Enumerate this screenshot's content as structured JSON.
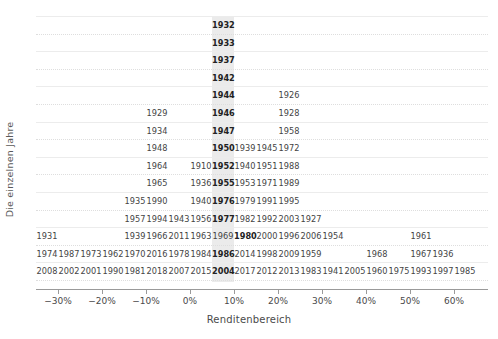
{
  "chart_data": {
    "type": "bar",
    "subtype": "year-stacked-histogram",
    "title": "",
    "xlabel": "Renditenbereich",
    "ylabel": "Die einzelnen Jahre",
    "xlim": [
      -35,
      70
    ],
    "bin_width": 5,
    "grid": true,
    "legend": null,
    "highlight": {
      "bin_label": "10%",
      "bin_start": 10,
      "bin_end": 15,
      "color": "#e8e8e8"
    },
    "x_ticks": [
      {
        "value": -30,
        "label": "−30%"
      },
      {
        "value": -20,
        "label": "−20%"
      },
      {
        "value": -10,
        "label": "−10%"
      },
      {
        "value": 0,
        "label": "0%"
      },
      {
        "value": 10,
        "label": "10%"
      },
      {
        "value": 20,
        "label": "20%"
      },
      {
        "value": 30,
        "label": "30%"
      },
      {
        "value": 40,
        "label": "40%"
      },
      {
        "value": 50,
        "label": "50%"
      },
      {
        "value": 60,
        "label": "60%"
      }
    ],
    "bins": [
      {
        "start": -35,
        "center": -32.5,
        "years": [
          "1931",
          "1974",
          "2008"
        ]
      },
      {
        "start": -30,
        "center": -27.5,
        "years": [
          "1987",
          "2002"
        ]
      },
      {
        "start": -25,
        "center": -22.5,
        "years": [
          "1973",
          "2001"
        ]
      },
      {
        "start": -20,
        "center": -17.5,
        "years": [
          "1962",
          "1990"
        ]
      },
      {
        "start": -15,
        "center": -12.5,
        "years": [
          "1935",
          "1957",
          "1939",
          "1970",
          "1981"
        ]
      },
      {
        "start": -10,
        "center": -7.5,
        "years": [
          "1929",
          "1934",
          "1948",
          "1964",
          "1965",
          "1990",
          "1994",
          "1966",
          "2016",
          "2018"
        ]
      },
      {
        "start": -5,
        "center": -2.5,
        "years": [
          "1943",
          "2011",
          "1978",
          "2007"
        ]
      },
      {
        "start": 0,
        "center": 2.5,
        "years": [
          "1910",
          "1936",
          "1940",
          "1956",
          "1963",
          "1984",
          "2015"
        ]
      },
      {
        "start": 5,
        "center": 7.5,
        "years": [
          "1939",
          "1940",
          "1953",
          "1979",
          "1982",
          "1969",
          "1986",
          "2017"
        ]
      },
      {
        "start": 10,
        "center": 12.5,
        "years": [
          "1932",
          "1933",
          "1937",
          "1942",
          "1944",
          "1946",
          "1947",
          "1950",
          "1952",
          "1955",
          "1976",
          "1977",
          "1980",
          "1986",
          "2004"
        ]
      },
      {
        "start": 15,
        "center": 17.5,
        "years": [
          "1939",
          "1940",
          "1953",
          "1979",
          "1982",
          "2000",
          "2014",
          "2017"
        ]
      },
      {
        "start": 20,
        "center": 22.5,
        "years": [
          "1945",
          "1951",
          "1971",
          "1991",
          "1992",
          "1996",
          "1998",
          "2012"
        ]
      },
      {
        "start": 25,
        "center": 27.5,
        "years": [
          "1972",
          "1988",
          "1989",
          "1995",
          "2003",
          "2006",
          "2009",
          "2013"
        ]
      },
      {
        "start": 30,
        "center": 32.5,
        "years": [
          "1927",
          "1954",
          "1959",
          "1983"
        ]
      },
      {
        "start": 35,
        "center": 37.5,
        "years": [
          "1941"
        ]
      },
      {
        "start": 40,
        "center": 42.5,
        "years": [
          "2005"
        ]
      },
      {
        "start": 45,
        "center": 47.5,
        "years": [
          "1968",
          "1960"
        ]
      },
      {
        "start": 50,
        "center": 52.5,
        "years": [
          "1961",
          "1967",
          "1975"
        ]
      },
      {
        "start": 55,
        "center": 57.5,
        "years": [
          "1936",
          "1993"
        ]
      },
      {
        "start": 60,
        "center": 62.5,
        "years": [
          "1997"
        ]
      },
      {
        "start": 65,
        "center": 67.5,
        "years": [
          "1985"
        ]
      }
    ],
    "rows": [
      {
        "row": 1,
        "cells": [
          {
            "col": 9,
            "year": "1932",
            "modal": true
          }
        ]
      },
      {
        "row": 2,
        "cells": [
          {
            "col": 9,
            "year": "1933",
            "modal": true
          }
        ]
      },
      {
        "row": 3,
        "cells": [
          {
            "col": 9,
            "year": "1937",
            "modal": true
          }
        ]
      },
      {
        "row": 4,
        "cells": [
          {
            "col": 9,
            "year": "1942",
            "modal": true
          }
        ]
      },
      {
        "row": 5,
        "cells": [
          {
            "col": 9,
            "year": "1944",
            "modal": true
          },
          {
            "col": 12,
            "year": "1926",
            "modal": false
          }
        ]
      },
      {
        "row": 6,
        "cells": [
          {
            "col": 6,
            "year": "1929",
            "modal": false
          },
          {
            "col": 9,
            "year": "1946",
            "modal": true
          },
          {
            "col": 12,
            "year": "1928",
            "modal": false
          }
        ]
      },
      {
        "row": 7,
        "cells": [
          {
            "col": 6,
            "year": "1934",
            "modal": false
          },
          {
            "col": 9,
            "year": "1947",
            "modal": true
          },
          {
            "col": 12,
            "year": "1958",
            "modal": false
          }
        ]
      },
      {
        "row": 8,
        "cells": [
          {
            "col": 6,
            "year": "1948",
            "modal": false
          },
          {
            "col": 9,
            "year": "1950",
            "modal": true
          },
          {
            "col": 10,
            "year": "1939",
            "modal": false
          },
          {
            "col": 11,
            "year": "1945",
            "modal": false
          },
          {
            "col": 12,
            "year": "1972",
            "modal": false
          }
        ]
      },
      {
        "row": 9,
        "cells": [
          {
            "col": 6,
            "year": "1964",
            "modal": false
          },
          {
            "col": 8,
            "year": "1910",
            "modal": false
          },
          {
            "col": 9,
            "year": "1952",
            "modal": true
          },
          {
            "col": 10,
            "year": "1940",
            "modal": false
          },
          {
            "col": 11,
            "year": "1951",
            "modal": false
          },
          {
            "col": 12,
            "year": "1988",
            "modal": false
          }
        ]
      },
      {
        "row": 10,
        "cells": [
          {
            "col": 6,
            "year": "1965",
            "modal": false
          },
          {
            "col": 8,
            "year": "1936",
            "modal": false
          },
          {
            "col": 9,
            "year": "1955",
            "modal": true
          },
          {
            "col": 10,
            "year": "1953",
            "modal": false
          },
          {
            "col": 11,
            "year": "1971",
            "modal": false
          },
          {
            "col": 12,
            "year": "1989",
            "modal": false
          }
        ]
      },
      {
        "row": 11,
        "cells": [
          {
            "col": 5,
            "year": "1935",
            "modal": false
          },
          {
            "col": 6,
            "year": "1990",
            "modal": false
          },
          {
            "col": 8,
            "year": "1940",
            "modal": false
          },
          {
            "col": 9,
            "year": "1976",
            "modal": true
          },
          {
            "col": 10,
            "year": "1979",
            "modal": false
          },
          {
            "col": 11,
            "year": "1991",
            "modal": false
          },
          {
            "col": 12,
            "year": "1995",
            "modal": false
          }
        ]
      },
      {
        "row": 12,
        "cells": [
          {
            "col": 5,
            "year": "1957",
            "modal": false
          },
          {
            "col": 6,
            "year": "1994",
            "modal": false
          },
          {
            "col": 7,
            "year": "1943",
            "modal": false
          },
          {
            "col": 8,
            "year": "1956",
            "modal": false
          },
          {
            "col": 9,
            "year": "1977",
            "modal": true
          },
          {
            "col": 10,
            "year": "1982",
            "modal": false
          },
          {
            "col": 11,
            "year": "1992",
            "modal": false
          },
          {
            "col": 12,
            "year": "2003",
            "modal": false
          },
          {
            "col": 13,
            "year": "1927",
            "modal": false
          }
        ]
      },
      {
        "row": 13,
        "cells": [
          {
            "col": 1,
            "year": "1931",
            "modal": false
          },
          {
            "col": 5,
            "year": "1939",
            "modal": false
          },
          {
            "col": 6,
            "year": "1966",
            "modal": false
          },
          {
            "col": 7,
            "year": "2011",
            "modal": false
          },
          {
            "col": 8,
            "year": "1963",
            "modal": false
          },
          {
            "col": 9,
            "year": "1969",
            "modal": false
          },
          {
            "col": 10,
            "year": "1980",
            "modal": true
          },
          {
            "col": 11,
            "year": "2000",
            "modal": false
          },
          {
            "col": 12,
            "year": "1996",
            "modal": false
          },
          {
            "col": 13,
            "year": "2006",
            "modal": false
          },
          {
            "col": 14,
            "year": "1954",
            "modal": false
          },
          {
            "col": 18,
            "year": "1961",
            "modal": false
          }
        ]
      },
      {
        "row": 14,
        "cells": [
          {
            "col": 1,
            "year": "1974",
            "modal": false
          },
          {
            "col": 2,
            "year": "1987",
            "modal": false
          },
          {
            "col": 3,
            "year": "1973",
            "modal": false
          },
          {
            "col": 4,
            "year": "1962",
            "modal": false
          },
          {
            "col": 5,
            "year": "1970",
            "modal": false
          },
          {
            "col": 6,
            "year": "2016",
            "modal": false
          },
          {
            "col": 7,
            "year": "1978",
            "modal": false
          },
          {
            "col": 8,
            "year": "1984",
            "modal": false
          },
          {
            "col": 9,
            "year": "1986",
            "modal": true
          },
          {
            "col": 10,
            "year": "2014",
            "modal": false
          },
          {
            "col": 11,
            "year": "1998",
            "modal": false
          },
          {
            "col": 12,
            "year": "2009",
            "modal": false
          },
          {
            "col": 13,
            "year": "1959",
            "modal": false
          },
          {
            "col": 16,
            "year": "1968",
            "modal": false
          },
          {
            "col": 18,
            "year": "1967",
            "modal": false
          },
          {
            "col": 19,
            "year": "1936",
            "modal": false
          }
        ]
      },
      {
        "row": 15,
        "cells": [
          {
            "col": 1,
            "year": "2008",
            "modal": false
          },
          {
            "col": 2,
            "year": "2002",
            "modal": false
          },
          {
            "col": 3,
            "year": "2001",
            "modal": false
          },
          {
            "col": 4,
            "year": "1990",
            "modal": false
          },
          {
            "col": 5,
            "year": "1981",
            "modal": false
          },
          {
            "col": 6,
            "year": "2018",
            "modal": false
          },
          {
            "col": 7,
            "year": "2007",
            "modal": false
          },
          {
            "col": 8,
            "year": "2015",
            "modal": false
          },
          {
            "col": 9,
            "year": "2004",
            "modal": true
          },
          {
            "col": 10,
            "year": "2017",
            "modal": false
          },
          {
            "col": 11,
            "year": "2012",
            "modal": false
          },
          {
            "col": 12,
            "year": "2013",
            "modal": false
          },
          {
            "col": 13,
            "year": "1983",
            "modal": false
          },
          {
            "col": 14,
            "year": "1941",
            "modal": false
          },
          {
            "col": 15,
            "year": "2005",
            "modal": false
          },
          {
            "col": 16,
            "year": "1960",
            "modal": false
          },
          {
            "col": 17,
            "year": "1975",
            "modal": false
          },
          {
            "col": 18,
            "year": "1993",
            "modal": false
          },
          {
            "col": 19,
            "year": "1997",
            "modal": false
          },
          {
            "col": 20,
            "year": "1985",
            "modal": false
          }
        ]
      }
    ]
  }
}
